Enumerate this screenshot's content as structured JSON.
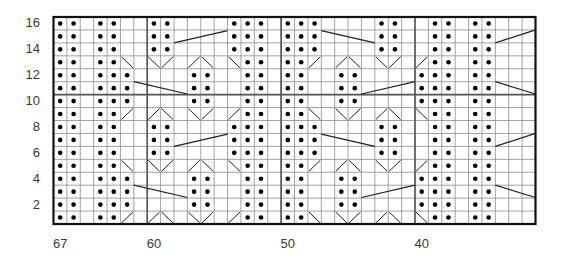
{
  "chart": {
    "type": "knitting-chart",
    "num_rows": 16,
    "num_cols": 36,
    "first_stitch": 67,
    "last_stitch": 32,
    "row_labels": [
      "16",
      "14",
      "12",
      "10",
      "8",
      "6",
      "4",
      "2"
    ],
    "row_label_rows": [
      16,
      14,
      12,
      10,
      8,
      6,
      4,
      2
    ],
    "col_labels": [
      {
        "text": "67",
        "col": 0
      },
      {
        "text": "60",
        "col": 7
      },
      {
        "text": "50",
        "col": 17
      },
      {
        "text": "40",
        "col": 27
      }
    ],
    "thick_vertical_after_cols": [
      7,
      17,
      27
    ],
    "thick_horizontal_above_rows": [
      10
    ],
    "legend_symbols": {
      ".": "knit (blank)",
      "o": "purl (dot)",
      "/": "diagonal rising",
      "\\": "diagonal falling"
    },
    "rows": [
      {
        "row": 16,
        "cells": "oo.oo..oo....ooo.ooo....oo..oo.oo..."
      },
      {
        "row": 15,
        "cells": "oo.oo..oo....ooo.ooo....oo..oo.oo..."
      },
      {
        "row": 14,
        "cells": "oo.oo..oo....ooo.ooo....oo..oo.oo..."
      },
      {
        "row": 13,
        "cells": "oo.oo\\.\\/./\\.\\oo.oo/./\\.\\/./oo.oo..."
      },
      {
        "row": 12,
        "cells": "oo.ooo....oo..oo.oo..oo....ooo.oo..."
      },
      {
        "row": 11,
        "cells": "oo.ooo....oo..oo.oo..oo....ooo.oo..."
      },
      {
        "row": 10,
        "cells": "oo.ooo....oo..oo.oo..oo....ooo.oo..."
      },
      {
        "row": 9,
        "cells": "oo.oo/./\\.\\/./oo.oo\\.\\/./\\.\\oo.oo..."
      },
      {
        "row": 8,
        "cells": "oo.oo..oo....ooo.ooo....oo..oo.oo..."
      },
      {
        "row": 7,
        "cells": "oo.oo..oo....ooo.ooo....oo..oo.oo..."
      },
      {
        "row": 6,
        "cells": "oo.oo..oo....ooo.ooo....oo..oo.oo..."
      },
      {
        "row": 5,
        "cells": "oo.oo\\.\\/./\\.\\oo.oo/./\\.\\/./oo.oo..."
      },
      {
        "row": 4,
        "cells": "oo.ooo....oo..oo.oo..oo....ooo.oo..."
      },
      {
        "row": 3,
        "cells": "oo.ooo....oo..oo.oo..oo....ooo.oo..."
      },
      {
        "row": 2,
        "cells": "oo.ooo....oo..oo.oo..oo....ooo.oo..."
      },
      {
        "row": 1,
        "cells": "oo.oo/./\\.\\/./oo.oo\\.\\/./\\.\\oo.oo..."
      }
    ],
    "cable_lines": [
      {
        "x1": 9,
        "y1": 2.0,
        "x2": 13,
        "y2": 1.05
      },
      {
        "x1": 6,
        "y1": 5.0,
        "x2": 10,
        "y2": 5.95
      },
      {
        "x1": 20,
        "y1": 1.05,
        "x2": 24,
        "y2": 2.0
      },
      {
        "x1": 23,
        "y1": 5.95,
        "x2": 27,
        "y2": 5.0
      },
      {
        "x1": 33,
        "y1": 2.0,
        "x2": 36,
        "y2": 1.0
      },
      {
        "x1": 33,
        "y1": 5.0,
        "x2": 36,
        "y2": 5.95
      },
      {
        "x1": 9,
        "y1": 10.0,
        "x2": 13,
        "y2": 9.05
      },
      {
        "x1": 6,
        "y1": 13.0,
        "x2": 10,
        "y2": 13.95
      },
      {
        "x1": 20,
        "y1": 9.05,
        "x2": 24,
        "y2": 10.0
      },
      {
        "x1": 23,
        "y1": 13.95,
        "x2": 27,
        "y2": 13.0
      },
      {
        "x1": 33,
        "y1": 10.0,
        "x2": 36,
        "y2": 9.0
      },
      {
        "x1": 33,
        "y1": 13.0,
        "x2": 36,
        "y2": 13.95
      }
    ],
    "colors": {
      "grid_line": "#8c8c8c",
      "border": "#111111",
      "thick_line": "#555555",
      "dot": "#000000",
      "label": "#3a3a3a"
    }
  }
}
